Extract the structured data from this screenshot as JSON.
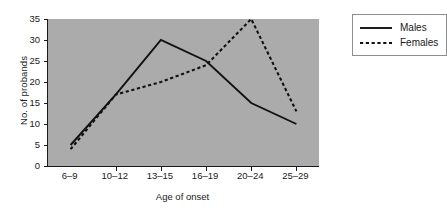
{
  "chart_data": {
    "type": "line",
    "title": "",
    "xlabel": "Age of onset",
    "ylabel": "No. of probands",
    "categories": [
      "6–9",
      "10–12",
      "13–15",
      "16–19",
      "20–24",
      "25–29"
    ],
    "ylim": [
      0,
      35
    ],
    "yticks": [
      0,
      5,
      10,
      15,
      20,
      25,
      30,
      35
    ],
    "grid": false,
    "legend_position": "outside-top-right",
    "plot_background": "#ababab",
    "series": [
      {
        "name": "Males",
        "style": "solid",
        "color": "#111111",
        "values": [
          5,
          17,
          30,
          25,
          15,
          10
        ]
      },
      {
        "name": "Females",
        "style": "dotted",
        "color": "#111111",
        "values": [
          4,
          17,
          20,
          24,
          35,
          13
        ]
      }
    ]
  },
  "legend": {
    "items": [
      {
        "label": "Males"
      },
      {
        "label": "Females"
      }
    ]
  }
}
